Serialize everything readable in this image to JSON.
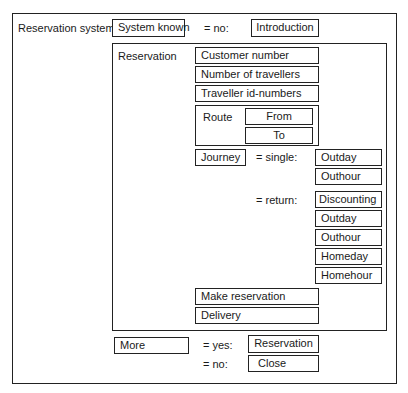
{
  "diagram": {
    "root_label": "Reservation system",
    "system_known": {
      "box_label": "System known",
      "condition_no": "= no:",
      "target_no": "Introduction"
    },
    "reservation": {
      "label": "Reservation",
      "fields": [
        "Customer number",
        "Number of travellers",
        "Traveller id-numbers"
      ],
      "route": {
        "label": "Route",
        "from": "From",
        "to": "To"
      },
      "journey": {
        "label": "Journey",
        "single": {
          "condition": "= single:",
          "items": [
            "Outday",
            "Outhour"
          ]
        },
        "return": {
          "condition": "= return:",
          "items": [
            "Discounting",
            "Outday",
            "Outhour",
            "Homeday",
            "Homehour"
          ]
        }
      },
      "actions": [
        "Make reservation",
        "Delivery"
      ]
    },
    "more": {
      "label": "More",
      "condition_yes": "= yes:",
      "target_yes": "Reservation",
      "condition_no": "= no:",
      "target_no": "Close"
    }
  }
}
